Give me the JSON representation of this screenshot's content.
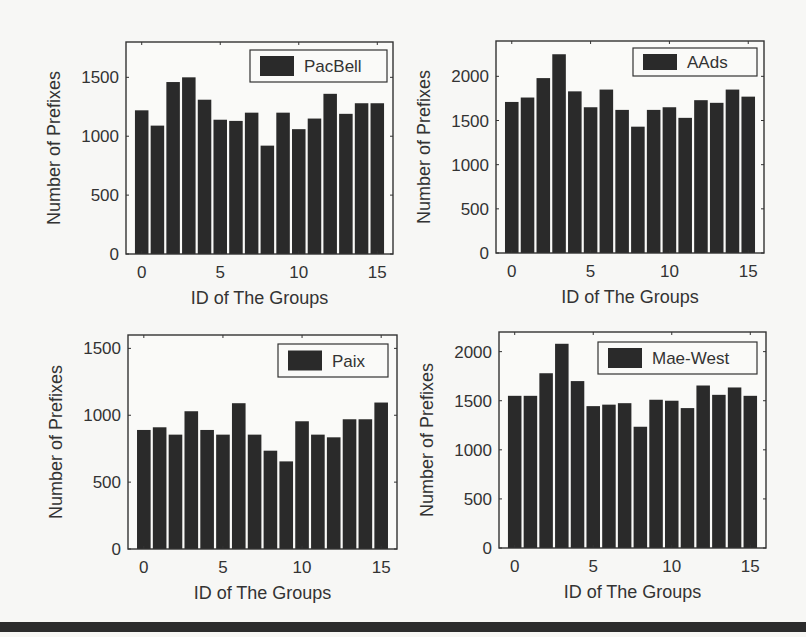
{
  "figure": {
    "background": "#f7f7f5",
    "bar_color": "#2a2a2a",
    "axis_color": "#333333",
    "rule_color": "#2c2c2c"
  },
  "chart_data": [
    {
      "type": "bar",
      "title": "",
      "legend": [
        "PacBell"
      ],
      "legend_position": "upper right",
      "xlabel": "ID of The Groups",
      "ylabel": "Number of Prefixes",
      "categories": [
        0,
        1,
        2,
        3,
        4,
        5,
        6,
        7,
        8,
        9,
        10,
        11,
        12,
        13,
        14,
        15
      ],
      "x_ticks": [
        0,
        5,
        10,
        15
      ],
      "y_ticks": [
        0,
        500,
        1000,
        1500
      ],
      "xlim": [
        -1,
        16
      ],
      "ylim": [
        0,
        1800
      ],
      "grid": false,
      "series": [
        {
          "name": "PacBell",
          "values": [
            1220,
            1090,
            1460,
            1500,
            1310,
            1140,
            1130,
            1200,
            920,
            1200,
            1060,
            1150,
            1360,
            1190,
            1280,
            1280
          ]
        }
      ]
    },
    {
      "type": "bar",
      "title": "",
      "legend": [
        "AAds"
      ],
      "legend_position": "upper right",
      "xlabel": "ID of The Groups",
      "ylabel": "Number of Prefixes",
      "categories": [
        0,
        1,
        2,
        3,
        4,
        5,
        6,
        7,
        8,
        9,
        10,
        11,
        12,
        13,
        14,
        15
      ],
      "x_ticks": [
        0,
        5,
        10,
        15
      ],
      "y_ticks": [
        0,
        500,
        1000,
        1500,
        2000
      ],
      "xlim": [
        -1,
        16
      ],
      "ylim": [
        0,
        2400
      ],
      "grid": false,
      "series": [
        {
          "name": "AAds",
          "values": [
            1710,
            1760,
            1980,
            2250,
            1830,
            1650,
            1850,
            1620,
            1430,
            1620,
            1650,
            1530,
            1730,
            1700,
            1850,
            1770
          ]
        }
      ]
    },
    {
      "type": "bar",
      "title": "",
      "legend": [
        "Paix"
      ],
      "legend_position": "upper right",
      "xlabel": "ID of The Groups",
      "ylabel": "Number of Prefixes",
      "categories": [
        0,
        1,
        2,
        3,
        4,
        5,
        6,
        7,
        8,
        9,
        10,
        11,
        12,
        13,
        14,
        15
      ],
      "x_ticks": [
        0,
        5,
        10,
        15
      ],
      "y_ticks": [
        0,
        500,
        1000,
        1500
      ],
      "xlim": [
        -1,
        16
      ],
      "ylim": [
        0,
        1600
      ],
      "grid": false,
      "series": [
        {
          "name": "Paix",
          "values": [
            890,
            910,
            855,
            1030,
            890,
            855,
            1090,
            855,
            735,
            655,
            955,
            855,
            835,
            970,
            970,
            1095
          ]
        }
      ]
    },
    {
      "type": "bar",
      "title": "",
      "legend": [
        "Mae-West"
      ],
      "legend_position": "upper right",
      "xlabel": "ID of The Groups",
      "ylabel": "Number of Prefixes",
      "categories": [
        0,
        1,
        2,
        3,
        4,
        5,
        6,
        7,
        8,
        9,
        10,
        11,
        12,
        13,
        14,
        15
      ],
      "x_ticks": [
        0,
        5,
        10,
        15
      ],
      "y_ticks": [
        0,
        500,
        1000,
        1500,
        2000
      ],
      "xlim": [
        -1,
        16
      ],
      "ylim": [
        0,
        2200
      ],
      "grid": false,
      "series": [
        {
          "name": "Mae-West",
          "values": [
            1550,
            1550,
            1780,
            2080,
            1700,
            1445,
            1460,
            1475,
            1235,
            1510,
            1500,
            1425,
            1655,
            1560,
            1635,
            1550
          ]
        }
      ]
    }
  ]
}
